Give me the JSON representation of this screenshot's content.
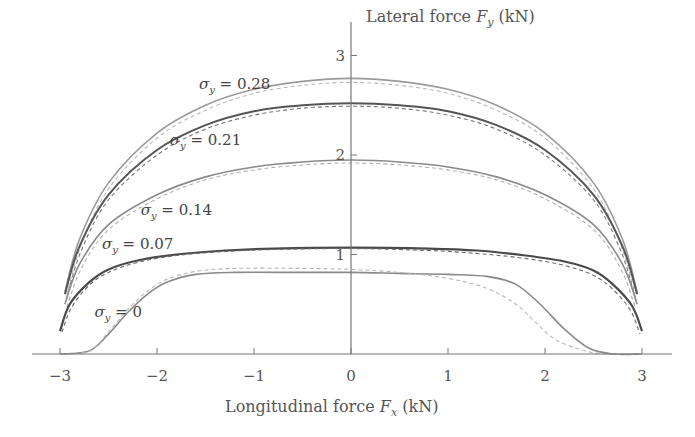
{
  "chart_data": {
    "type": "line",
    "title": "",
    "xlabel": "Longitudinal force F_x (kN)",
    "ylabel": "Lateral force F_y (kN)",
    "xlim": [
      -3.3,
      3.3
    ],
    "ylim": [
      0,
      3.3
    ],
    "grid": false,
    "x_ticks": [
      -3,
      -2,
      -1,
      0,
      1,
      2,
      3
    ],
    "x_tick_labels": [
      "−3",
      "−2",
      "−1",
      "0",
      "1",
      "2",
      "3"
    ],
    "y_ticks": [
      1,
      2,
      3
    ],
    "y_tick_labels": [
      "1",
      "2",
      "3"
    ],
    "legend": "none (inline curve labels)",
    "series": [
      {
        "name": "σy = 0.28",
        "style": "solid",
        "color": "#9a9a9a",
        "width": 1.6,
        "x": [
          -2.95,
          -2.8,
          -2.5,
          -2.0,
          -1.5,
          -1.0,
          -0.5,
          0,
          0.5,
          1.0,
          1.5,
          2.0,
          2.5,
          2.8,
          2.95
        ],
        "y": [
          0.62,
          1.15,
          1.72,
          2.22,
          2.5,
          2.66,
          2.74,
          2.77,
          2.74,
          2.66,
          2.5,
          2.22,
          1.72,
          1.15,
          0.62
        ]
      },
      {
        "name": "σy = 0.28 (model)",
        "style": "dashed",
        "color": "#b8b8b8",
        "width": 1.1,
        "x": [
          -2.93,
          -2.78,
          -2.5,
          -2.0,
          -1.5,
          -1.0,
          -0.5,
          0,
          0.5,
          1.0,
          1.5,
          2.0,
          2.5,
          2.78,
          2.93
        ],
        "y": [
          0.6,
          1.1,
          1.66,
          2.17,
          2.45,
          2.62,
          2.7,
          2.73,
          2.7,
          2.62,
          2.45,
          2.17,
          1.66,
          1.1,
          0.6
        ]
      },
      {
        "name": "σy = 0.21",
        "style": "solid",
        "color": "#555555",
        "width": 2.0,
        "x": [
          -2.95,
          -2.8,
          -2.5,
          -2.0,
          -1.5,
          -1.0,
          -0.5,
          0,
          0.5,
          1.0,
          1.5,
          2.0,
          2.5,
          2.8,
          2.95
        ],
        "y": [
          0.6,
          1.08,
          1.6,
          2.05,
          2.3,
          2.44,
          2.5,
          2.52,
          2.5,
          2.44,
          2.3,
          2.05,
          1.6,
          1.08,
          0.6
        ]
      },
      {
        "name": "σy = 0.21 (model)",
        "style": "dashed",
        "color": "#777777",
        "width": 1.1,
        "x": [
          -2.93,
          -2.78,
          -2.5,
          -2.0,
          -1.5,
          -1.0,
          -0.5,
          0,
          0.5,
          1.0,
          1.5,
          2.0,
          2.5,
          2.78,
          2.93
        ],
        "y": [
          0.57,
          1.04,
          1.55,
          2.0,
          2.26,
          2.4,
          2.47,
          2.49,
          2.47,
          2.4,
          2.26,
          2.0,
          1.55,
          1.04,
          0.57
        ]
      },
      {
        "name": "σy = 0.14",
        "style": "solid",
        "color": "#8a8a8a",
        "width": 1.6,
        "x": [
          -2.95,
          -2.8,
          -2.5,
          -2.0,
          -1.5,
          -1.0,
          -0.5,
          0,
          0.5,
          1.0,
          1.5,
          2.0,
          2.5,
          2.8,
          2.95
        ],
        "y": [
          0.5,
          0.9,
          1.3,
          1.6,
          1.78,
          1.88,
          1.93,
          1.95,
          1.93,
          1.88,
          1.78,
          1.6,
          1.3,
          0.9,
          0.5
        ]
      },
      {
        "name": "σy = 0.14 (model)",
        "style": "dashed",
        "color": "#b0b0b0",
        "width": 1.1,
        "x": [
          -2.93,
          -2.78,
          -2.5,
          -2.0,
          -1.5,
          -1.0,
          -0.5,
          0,
          0.5,
          1.0,
          1.5,
          2.0,
          2.5,
          2.78,
          2.93
        ],
        "y": [
          0.47,
          0.86,
          1.25,
          1.56,
          1.75,
          1.85,
          1.9,
          1.92,
          1.9,
          1.85,
          1.75,
          1.56,
          1.25,
          0.86,
          0.47
        ]
      },
      {
        "name": "σy = 0.07",
        "style": "solid",
        "color": "#4a4a4a",
        "width": 2.2,
        "x": [
          -3.0,
          -2.9,
          -2.7,
          -2.5,
          -2.2,
          -1.8,
          -1.3,
          -0.8,
          0,
          0.8,
          1.3,
          1.8,
          2.2,
          2.5,
          2.7,
          2.9,
          3.0
        ],
        "y": [
          0.23,
          0.5,
          0.72,
          0.85,
          0.94,
          1.0,
          1.04,
          1.06,
          1.07,
          1.06,
          1.04,
          0.99,
          0.93,
          0.84,
          0.7,
          0.48,
          0.23
        ]
      },
      {
        "name": "σy = 0.07 (model)",
        "style": "dashed",
        "color": "#6a6a6a",
        "width": 1.1,
        "x": [
          -2.98,
          -2.88,
          -2.7,
          -2.5,
          -2.2,
          -1.8,
          -1.3,
          -0.8,
          0,
          0.8,
          1.3,
          1.8,
          2.2,
          2.5,
          2.7,
          2.88,
          2.98
        ],
        "y": [
          0.22,
          0.47,
          0.69,
          0.82,
          0.92,
          0.99,
          1.03,
          1.05,
          1.06,
          1.04,
          1.01,
          0.96,
          0.89,
          0.79,
          0.65,
          0.44,
          0.2
        ]
      },
      {
        "name": "σy = 0",
        "style": "solid",
        "color": "#8a8a8a",
        "width": 1.6,
        "x": [
          -3.0,
          -2.7,
          -2.5,
          -2.3,
          -2.1,
          -1.9,
          -1.6,
          -1.2,
          -0.5,
          0,
          0.5,
          1.0,
          1.4,
          1.7,
          1.95,
          2.2,
          2.45,
          2.7,
          3.0
        ],
        "y": [
          0,
          0.03,
          0.2,
          0.42,
          0.6,
          0.72,
          0.8,
          0.82,
          0.82,
          0.82,
          0.81,
          0.8,
          0.78,
          0.7,
          0.5,
          0.25,
          0.06,
          0,
          0
        ]
      },
      {
        "name": "σy = 0 (model)",
        "style": "dashed",
        "color": "#b5b5b5",
        "width": 1.1,
        "x": [
          -3.0,
          -2.7,
          -2.5,
          -2.3,
          -2.1,
          -1.9,
          -1.6,
          -1.2,
          -0.5,
          0,
          0.5,
          1.0,
          1.4,
          1.7,
          1.9,
          2.1,
          2.35,
          2.6,
          3.0
        ],
        "y": [
          0,
          0.03,
          0.22,
          0.45,
          0.63,
          0.75,
          0.83,
          0.86,
          0.86,
          0.85,
          0.82,
          0.76,
          0.66,
          0.5,
          0.32,
          0.15,
          0.05,
          0,
          0
        ]
      }
    ],
    "annotations": [
      {
        "text": "σy = 0.28",
        "x": -1.2,
        "y": 2.66
      },
      {
        "text": "σy = 0.21",
        "x": -1.5,
        "y": 2.1
      },
      {
        "text": "σy = 0.14",
        "x": -1.8,
        "y": 1.4
      },
      {
        "text": "σy = 0.07",
        "x": -2.2,
        "y": 1.06
      },
      {
        "text": "σy = 0",
        "x": -2.4,
        "y": 0.37
      }
    ]
  },
  "labels": {
    "x_axis_title": "Longitudinal force",
    "x_axis_symbol": "F",
    "x_axis_sub": "x",
    "x_axis_unit": "(kN)",
    "y_axis_title": "Lateral force",
    "y_axis_symbol": "F",
    "y_axis_sub": "y",
    "y_axis_unit": "(kN)"
  }
}
